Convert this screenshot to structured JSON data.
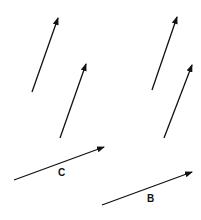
{
  "diagram": {
    "type": "vector-diagram",
    "stroke_color": "#111111",
    "background": "#ffffff",
    "vectors": [
      {
        "id": "v1",
        "label": "",
        "x1": 32,
        "y1": 92,
        "x2": 58,
        "y2": 18
      },
      {
        "id": "v2",
        "label": "",
        "x1": 60,
        "y1": 138,
        "x2": 86,
        "y2": 64
      },
      {
        "id": "v3",
        "label": "",
        "x1": 152,
        "y1": 90,
        "x2": 177,
        "y2": 17
      },
      {
        "id": "v4",
        "label": "",
        "x1": 164,
        "y1": 138,
        "x2": 192,
        "y2": 65
      },
      {
        "id": "C",
        "label": "C",
        "x1": 14,
        "y1": 180,
        "x2": 104,
        "y2": 147,
        "label_x": 58,
        "label_y": 176
      },
      {
        "id": "B",
        "label": "B",
        "x1": 102,
        "y1": 205,
        "x2": 192,
        "y2": 172,
        "label_x": 147,
        "label_y": 202
      }
    ]
  }
}
